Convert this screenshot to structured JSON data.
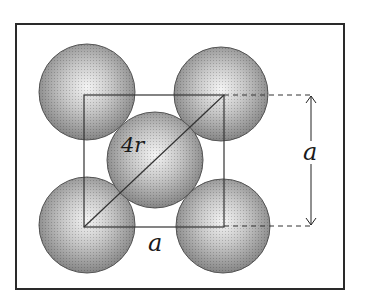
{
  "diagram": {
    "frame": {
      "x": 16,
      "y": 24,
      "width": 328,
      "height": 265,
      "stroke": "#2a2a2a"
    },
    "square": {
      "x": 84,
      "y": 95,
      "width": 140,
      "height": 132,
      "stroke": "#333333"
    },
    "atoms": [
      {
        "id": "top-left",
        "cx": 87,
        "cy": 92,
        "r": 48
      },
      {
        "id": "top-right",
        "cx": 221,
        "cy": 94,
        "r": 47
      },
      {
        "id": "center",
        "cx": 155,
        "cy": 160,
        "r": 48
      },
      {
        "id": "bottom-left",
        "cx": 87,
        "cy": 225,
        "r": 48
      },
      {
        "id": "bottom-right",
        "cx": 223,
        "cy": 226,
        "r": 47
      }
    ],
    "atom_colors": {
      "highlight": "#f4f4f4",
      "mid": "#b8b8b8",
      "edge": "#7a7a7a",
      "outline": "#555555"
    },
    "labels": {
      "diagonal": "4r",
      "bottom_edge": "a",
      "right_dimension": "a"
    },
    "dimension_arrow": {
      "x": 311,
      "y1": 95,
      "y2": 226
    },
    "dashed_lines": [
      {
        "x1": 224,
        "y1": 95,
        "x2": 313,
        "y2": 95
      },
      {
        "x1": 224,
        "y1": 226,
        "x2": 313,
        "y2": 226
      }
    ]
  }
}
